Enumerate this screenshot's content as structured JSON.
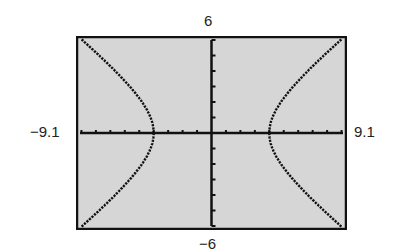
{
  "chart_data": {
    "type": "line",
    "title": "",
    "equation": "x^2/16 - y^2/9 = 1",
    "xlabel": "",
    "ylabel": "",
    "xlim": [
      -9.1,
      9.1
    ],
    "ylim": [
      -6,
      6
    ],
    "xscl": 1,
    "yscl": 1,
    "grid": false,
    "window_labels": {
      "xmin": "−9.1",
      "xmax": "9.1",
      "ymin": "−6",
      "ymax": "6"
    },
    "series": [
      {
        "name": "upper-right branch",
        "points": [
          [
            4,
            0
          ],
          [
            4.5,
            1.37
          ],
          [
            5,
            2.25
          ],
          [
            6,
            3.35
          ],
          [
            7,
            4.31
          ],
          [
            8,
            5.2
          ],
          [
            9,
            6.05
          ]
        ]
      },
      {
        "name": "lower-right branch",
        "points": [
          [
            4,
            0
          ],
          [
            4.5,
            -1.37
          ],
          [
            5,
            -2.25
          ],
          [
            6,
            -3.35
          ],
          [
            7,
            -4.31
          ],
          [
            8,
            -5.2
          ],
          [
            9,
            -6.05
          ]
        ]
      },
      {
        "name": "upper-left branch",
        "points": [
          [
            -4,
            0
          ],
          [
            -4.5,
            1.37
          ],
          [
            -5,
            2.25
          ],
          [
            -6,
            3.35
          ],
          [
            -7,
            4.31
          ],
          [
            -8,
            5.2
          ],
          [
            -9,
            6.05
          ]
        ]
      },
      {
        "name": "lower-left branch",
        "points": [
          [
            -4,
            0
          ],
          [
            -4.5,
            -1.37
          ],
          [
            -5,
            -2.25
          ],
          [
            -6,
            -3.35
          ],
          [
            -7,
            -4.31
          ],
          [
            -8,
            -5.2
          ],
          [
            -9,
            -6.05
          ]
        ]
      }
    ],
    "colors": {
      "screen": "#d6d6d6",
      "ink": "#111111",
      "frame": "#111111"
    }
  }
}
